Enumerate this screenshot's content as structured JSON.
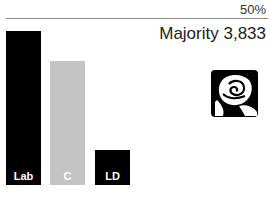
{
  "chart_data": {
    "type": "bar",
    "title": "",
    "categories": [
      "Lab",
      "C",
      "LD"
    ],
    "values": [
      46,
      37,
      10.5
    ],
    "colors": [
      "#000000",
      "#c4c4c4",
      "#000000"
    ],
    "reference_line": {
      "value": 50,
      "label": "50%"
    },
    "ylim": [
      0,
      50
    ],
    "grid": false,
    "annotation": "Majority 3,833",
    "winner_icon": "labour-rose-icon"
  },
  "labels": {
    "ref": "50%",
    "majority": "Majority 3,833",
    "bars": [
      "Lab",
      "C",
      "LD"
    ]
  }
}
